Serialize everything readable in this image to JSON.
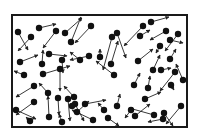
{
  "diagram": {
    "canvas": {
      "width": 199,
      "height": 139,
      "background": "#ffffff"
    },
    "container": {
      "x": 12,
      "y": 15,
      "width": 175,
      "height": 112,
      "stroke": "#1a1a1a",
      "stroke_width": 2
    },
    "particle_style": {
      "radius": 3.2,
      "fill": "#111111"
    },
    "arrow_style": {
      "stroke": "#222222",
      "stroke_width": 0.9,
      "head": 3
    },
    "particles": [
      {
        "x": 18,
        "y": 32,
        "ax": 28,
        "ay": 50
      },
      {
        "x": 31,
        "y": 37,
        "ax": 18,
        "ay": 51
      },
      {
        "x": 39,
        "y": 28,
        "ax": 56,
        "ay": 24
      },
      {
        "x": 56,
        "y": 31,
        "ax": 43,
        "ay": 48
      },
      {
        "x": 65,
        "y": 33,
        "ax": 82,
        "ay": 18
      },
      {
        "x": 71,
        "y": 42,
        "ax": 81,
        "ay": 17
      },
      {
        "x": 91,
        "y": 26,
        "ax": 75,
        "ay": 43
      },
      {
        "x": 112,
        "y": 37,
        "ax": 103,
        "ay": 70
      },
      {
        "x": 117,
        "y": 33,
        "ax": 126,
        "ay": 58
      },
      {
        "x": 140,
        "y": 36,
        "ax": 150,
        "ay": 30
      },
      {
        "x": 143,
        "y": 26,
        "ax": 124,
        "ay": 46
      },
      {
        "x": 151,
        "y": 22,
        "ax": 169,
        "ay": 17
      },
      {
        "x": 166,
        "y": 31,
        "ax": 150,
        "ay": 40
      },
      {
        "x": 160,
        "y": 46,
        "ax": 156,
        "ay": 53
      },
      {
        "x": 178,
        "y": 34,
        "ax": 165,
        "ay": 51
      },
      {
        "x": 170,
        "y": 40,
        "ax": 183,
        "ay": 43
      },
      {
        "x": 20,
        "y": 62,
        "ax": 38,
        "ay": 55
      },
      {
        "x": 42,
        "y": 64,
        "ax": 43,
        "ay": 50
      },
      {
        "x": 49,
        "y": 54,
        "ax": 67,
        "ay": 56
      },
      {
        "x": 62,
        "y": 60,
        "ax": 63,
        "ay": 73
      },
      {
        "x": 80,
        "y": 60,
        "ax": 70,
        "ay": 52
      },
      {
        "x": 24,
        "y": 75,
        "ax": 14,
        "ay": 71
      },
      {
        "x": 34,
        "y": 86,
        "ax": 16,
        "ay": 97
      },
      {
        "x": 43,
        "y": 74,
        "ax": 70,
        "ay": 66
      },
      {
        "x": 60,
        "y": 69,
        "ax": 60,
        "ay": 91
      },
      {
        "x": 89,
        "y": 56,
        "ax": 70,
        "ay": 60
      },
      {
        "x": 100,
        "y": 57,
        "ax": 100,
        "ay": 49
      },
      {
        "x": 111,
        "y": 64,
        "ax": 118,
        "ay": 41
      },
      {
        "x": 114,
        "y": 75,
        "ax": 96,
        "ay": 61
      },
      {
        "x": 134,
        "y": 85,
        "ax": 140,
        "ay": 73
      },
      {
        "x": 138,
        "y": 61,
        "ax": 153,
        "ay": 49
      },
      {
        "x": 153,
        "y": 70,
        "ax": 160,
        "ay": 55
      },
      {
        "x": 161,
        "y": 70,
        "ax": 171,
        "ay": 68
      },
      {
        "x": 170,
        "y": 59,
        "ax": 176,
        "ay": 49
      },
      {
        "x": 175,
        "y": 72,
        "ax": 160,
        "ay": 91
      },
      {
        "x": 183,
        "y": 80,
        "ax": 176,
        "ay": 64
      },
      {
        "x": 16,
        "y": 110,
        "ax": 36,
        "ay": 119
      },
      {
        "x": 34,
        "y": 102,
        "ax": 16,
        "ay": 115
      },
      {
        "x": 48,
        "y": 93,
        "ax": 39,
        "ay": 83
      },
      {
        "x": 58,
        "y": 98,
        "ax": 59,
        "ay": 115
      },
      {
        "x": 68,
        "y": 99,
        "ax": 70,
        "ay": 121
      },
      {
        "x": 74,
        "y": 97,
        "ax": 64,
        "ay": 86
      },
      {
        "x": 75,
        "y": 104,
        "ax": 84,
        "ay": 121
      },
      {
        "x": 49,
        "y": 117,
        "ax": 48,
        "ay": 96
      },
      {
        "x": 30,
        "y": 121,
        "ax": 26,
        "ay": 117
      },
      {
        "x": 62,
        "y": 122,
        "ax": 59,
        "ay": 114
      },
      {
        "x": 72,
        "y": 106,
        "ax": 73,
        "ay": 103
      },
      {
        "x": 77,
        "y": 112,
        "ax": 89,
        "ay": 101
      },
      {
        "x": 85,
        "y": 104,
        "ax": 106,
        "ay": 100
      },
      {
        "x": 93,
        "y": 120,
        "ax": 72,
        "ay": 110
      },
      {
        "x": 104,
        "y": 110,
        "ax": 98,
        "ay": 103
      },
      {
        "x": 117,
        "y": 106,
        "ax": 120,
        "ay": 94
      },
      {
        "x": 131,
        "y": 110,
        "ax": 125,
        "ay": 118
      },
      {
        "x": 108,
        "y": 118,
        "ax": 119,
        "ay": 126
      },
      {
        "x": 135,
        "y": 116,
        "ax": 150,
        "ay": 104
      },
      {
        "x": 148,
        "y": 88,
        "ax": 150,
        "ay": 76
      },
      {
        "x": 145,
        "y": 99,
        "ax": 161,
        "ay": 92
      },
      {
        "x": 154,
        "y": 115,
        "ax": 129,
        "ay": 108
      },
      {
        "x": 171,
        "y": 85,
        "ax": 174,
        "ay": 90
      },
      {
        "x": 163,
        "y": 119,
        "ax": 148,
        "ay": 122
      },
      {
        "x": 164,
        "y": 113,
        "ax": 173,
        "ay": 126
      },
      {
        "x": 181,
        "y": 106,
        "ax": 166,
        "ay": 124
      }
    ]
  }
}
